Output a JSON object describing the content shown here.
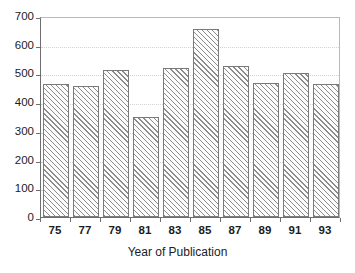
{
  "chart_data": {
    "type": "bar",
    "title": "",
    "subtitle": "",
    "xlabel": "Year of Publication",
    "ylabel": "",
    "categories": [
      "75",
      "77",
      "79",
      "81",
      "83",
      "85",
      "87",
      "89",
      "91",
      "93"
    ],
    "values": [
      463,
      456,
      512,
      350,
      518,
      655,
      525,
      465,
      500,
      463
    ],
    "ylim": [
      0,
      700
    ],
    "yticks": [
      0,
      100,
      200,
      300,
      400,
      500,
      600,
      700
    ],
    "ytick_labels": [
      "0",
      "100",
      "200",
      "300",
      "400",
      "500",
      "600",
      "700"
    ],
    "xtick_labels": [
      "75",
      "77",
      "79",
      "81",
      "83",
      "85",
      "87",
      "89",
      "91",
      "93"
    ],
    "grid": true,
    "gridlines_at": [
      100,
      200,
      300,
      400,
      500,
      600
    ],
    "legend": null,
    "legend_position": "none",
    "series": [
      {
        "name": "Publications",
        "values": [
          463,
          456,
          512,
          350,
          518,
          655,
          525,
          465,
          500,
          463
        ]
      }
    ],
    "annotations": []
  },
  "style": {
    "bar_fill": "#fcfcfc",
    "bar_hatch_color": "#8c8c8c",
    "bar_edge": "#7a7a7a",
    "axis_color": "#6e6e6e",
    "grid_color": "#d2d2d2",
    "text_color": "#1c1c1c",
    "background": "#ffffff",
    "hatch_pattern": "forward-diagonal"
  }
}
